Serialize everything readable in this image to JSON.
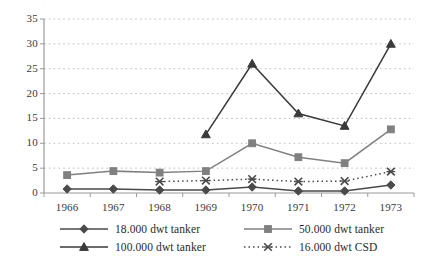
{
  "chart_data": {
    "type": "line",
    "title": "",
    "xlabel": "",
    "ylabel": "",
    "categories": [
      "1966",
      "1967",
      "1968",
      "1969",
      "1970",
      "1971",
      "1972",
      "1973"
    ],
    "ylim": [
      0,
      35
    ],
    "yticks": [
      0,
      5,
      10,
      15,
      20,
      25,
      30,
      35
    ],
    "ytick_labels": [
      "0",
      "5",
      "10",
      "15",
      "20",
      "25",
      "30",
      "35"
    ],
    "grid": true,
    "grid_style": "dotted-horizontal",
    "legend_position": "bottom",
    "series": [
      {
        "name": "18.000 dwt tanker",
        "marker": "diamond",
        "line_style": "solid",
        "color": "#4a4a4a",
        "values": [
          0.8,
          0.8,
          0.6,
          0.6,
          1.2,
          0.4,
          0.4,
          1.6
        ]
      },
      {
        "name": "50.000 dwt tanker",
        "marker": "square",
        "line_style": "solid",
        "color": "#808080",
        "values": [
          3.6,
          4.4,
          4.1,
          4.4,
          10.0,
          7.2,
          6.0,
          12.8
        ]
      },
      {
        "name": "100.000 dwt tanker",
        "marker": "triangle",
        "line_style": "solid",
        "color": "#3a3a3a",
        "values": [
          null,
          null,
          null,
          11.8,
          26.0,
          16.0,
          13.5,
          30.0
        ]
      },
      {
        "name": "16.000 dwt CSD",
        "marker": "x",
        "line_style": "dotted",
        "color": "#4a4a4a",
        "values": [
          null,
          null,
          2.3,
          2.5,
          2.8,
          2.3,
          2.4,
          4.3
        ]
      }
    ]
  },
  "legend": {
    "items": [
      {
        "label": "18.000 dwt tanker"
      },
      {
        "label": "50.000 dwt tanker"
      },
      {
        "label": "100.000 dwt tanker"
      },
      {
        "label": "16.000 dwt CSD"
      }
    ]
  },
  "colors": {
    "grid": "#c9b8b8",
    "axis": "#9a9a9a",
    "text": "#3a3a3a"
  }
}
